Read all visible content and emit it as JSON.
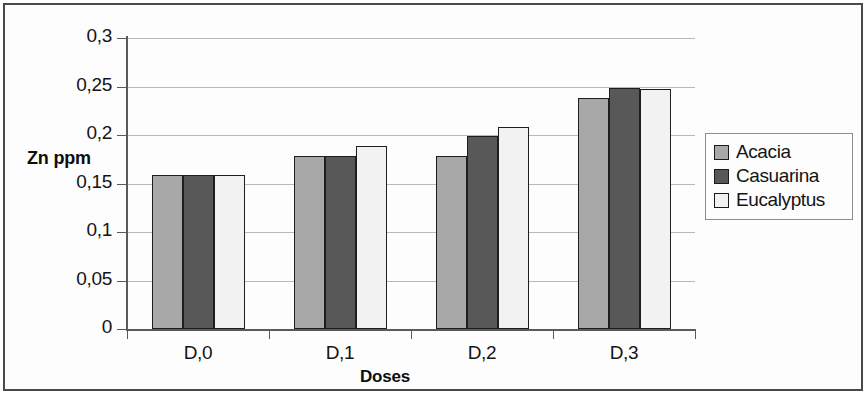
{
  "chart_data": {
    "type": "bar",
    "title": "",
    "subtitle": "",
    "xlabel": "Doses",
    "ylabel": "Zn ppm",
    "categories": [
      "D,0",
      "D,1",
      "D,2",
      "D,3"
    ],
    "series": [
      {
        "name": "Acacia",
        "color": "#a8a8a8",
        "values": [
          0.159,
          0.178,
          0.178,
          0.238
        ]
      },
      {
        "name": "Casuarina",
        "color": "#585858",
        "values": [
          0.159,
          0.178,
          0.199,
          0.248
        ]
      },
      {
        "name": "Eucalyptus",
        "color": "#f2f2f2",
        "values": [
          0.159,
          0.189,
          0.208,
          0.247
        ]
      }
    ],
    "ylim": [
      0,
      0.3
    ],
    "ytick_values": [
      0,
      0.05,
      0.1,
      0.15,
      0.2,
      0.25,
      0.3
    ],
    "ytick_labels": [
      "0",
      "0,05",
      "0,1",
      "0,15",
      "0,2",
      "0,25",
      "0,3"
    ],
    "decimal_separator": ",",
    "grid": "horizontal",
    "legend_position": "right",
    "legend_entries": [
      "Acacia",
      "Casuarina",
      "Eucalyptus"
    ],
    "bar_border_color": "#1e1e1e",
    "gridline_color": "#b9b9b9",
    "axis_color": "#5a5a5a",
    "plot_background": "#fdfdfd"
  }
}
